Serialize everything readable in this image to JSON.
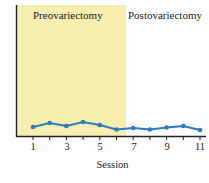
{
  "chart_data": {
    "type": "line",
    "title": "",
    "xlabel": "Session",
    "ylabel": "",
    "x": [
      1,
      2,
      3,
      4,
      5,
      6,
      7,
      8,
      9,
      10,
      11
    ],
    "series": [
      {
        "name": "Response",
        "color": "#2b7bbf",
        "values": [
          9,
          13,
          10,
          14,
          11,
          6.5,
          8,
          6.5,
          8.5,
          10,
          6
        ]
      }
    ],
    "xticks": [
      "1",
      "3",
      "5",
      "7",
      "9",
      "11"
    ],
    "yticks": [],
    "ylim": [
      0,
      131
    ],
    "xlim": [
      0,
      11.5
    ],
    "grid": false,
    "regions": [
      {
        "label": "Preovariectomy",
        "x_start": 0,
        "x_end": 6.5,
        "color": "#f7efb0"
      },
      {
        "label": "Postovariectomy",
        "x_start": 6.5,
        "x_end": 11.5,
        "color": "#ffffff"
      }
    ]
  },
  "labels": {
    "pre": "Preovariectomy",
    "post": "Postovariectomy",
    "xlabel": "Session",
    "ticks": [
      "1",
      "3",
      "5",
      "7",
      "9",
      "11"
    ]
  }
}
